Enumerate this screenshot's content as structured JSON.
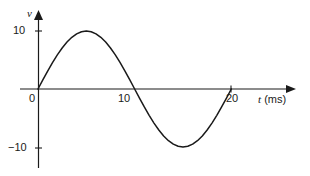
{
  "figure": {
    "name": "sine-voltage-waveform",
    "background_color": "#ffffff",
    "stroke_color": "#1a1a1a"
  },
  "axes": {
    "y_axis_label": "v",
    "x_axis_label_variable": "t",
    "x_axis_label_unit": "(ms)",
    "x_ticks": [
      {
        "value": 0,
        "label": "0"
      },
      {
        "value": 10,
        "label": "10"
      },
      {
        "value": 20,
        "label": "20"
      }
    ],
    "y_ticks": [
      {
        "value": 10,
        "label": "10"
      },
      {
        "value": -10,
        "label": "−10"
      }
    ]
  },
  "chart_data": {
    "type": "line",
    "title": "",
    "xlabel": "t (ms)",
    "ylabel": "v",
    "xlim": [
      0,
      20
    ],
    "ylim": [
      -10,
      10
    ],
    "grid": false,
    "legend": "none",
    "annotations": [],
    "series": [
      {
        "name": "v(t)",
        "equation": "v = 10 sin(2πt/20)",
        "amplitude": 10,
        "period_ms": 20,
        "x": [
          0,
          0.5,
          1,
          1.5,
          2,
          2.5,
          3,
          3.5,
          4,
          4.5,
          5,
          5.5,
          6,
          6.5,
          7,
          7.5,
          8,
          8.5,
          9,
          9.5,
          10,
          10.5,
          11,
          11.5,
          12,
          12.5,
          13,
          13.5,
          14,
          14.5,
          15,
          15.5,
          16,
          16.5,
          17,
          17.5,
          18,
          18.5,
          19,
          19.5,
          20
        ],
        "values": [
          0,
          1.56,
          3.09,
          4.54,
          5.88,
          7.07,
          8.09,
          8.91,
          9.51,
          9.88,
          10,
          9.88,
          9.51,
          8.91,
          8.09,
          7.07,
          5.88,
          4.54,
          3.09,
          1.56,
          0,
          -1.56,
          -3.09,
          -4.54,
          -5.88,
          -7.07,
          -8.09,
          -8.91,
          -9.51,
          -9.88,
          -10,
          -9.88,
          -9.51,
          -8.91,
          -8.09,
          -7.07,
          -5.88,
          -4.54,
          -3.09,
          -1.56,
          0
        ]
      }
    ]
  }
}
